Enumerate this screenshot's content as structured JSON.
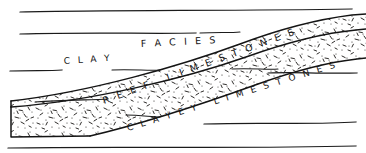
{
  "figure": {
    "kind": "geological-cross-section",
    "background_color": "#ffffff",
    "ink_color": "#141414",
    "width": 366,
    "height": 153
  },
  "labels": {
    "facies": "F A C I E S",
    "clay": "C L A Y",
    "reef_limestones": "R E E F   L I M E S T O N E S",
    "clayey_limestones": "C L A Y E Y   L I M E S T O N E S"
  },
  "units": [
    {
      "id": "clay",
      "name": "CLAY",
      "texture": "blank",
      "position": "upper-left"
    },
    {
      "id": "reef-limestones",
      "name": "REEF LIMESTONES",
      "texture": "stipple",
      "position": "diagonal-wedge"
    },
    {
      "id": "clayey-limestones",
      "name": "CLAYEY LIMESTONES",
      "texture": "blank",
      "position": "lower-right"
    }
  ],
  "bedding_lines": [
    {
      "id": "bed-1",
      "d": "M 20 12 L 352 9"
    },
    {
      "id": "bed-2",
      "d": "M 20 34 L 196 33"
    },
    {
      "id": "bed-3",
      "d": "M 10 71 L 62 70"
    },
    {
      "id": "bed-4",
      "d": "M 268 73 L 357 73"
    },
    {
      "id": "bed-5",
      "d": "M 204 124 L 356 122"
    },
    {
      "id": "bed-6",
      "d": "M 8 148 L 356 146"
    }
  ],
  "leader_lines": [
    {
      "id": "leader-facies",
      "d": "M 200 33 L 240 32"
    },
    {
      "id": "leader-clay",
      "d": "M 112 70 L 160 70"
    },
    {
      "id": "leader-reef-left",
      "d": "M 35 102 L 108 99"
    },
    {
      "id": "leader-reef-right",
      "d": "M 232 69 L 278 69"
    },
    {
      "id": "leader-clayey",
      "d": "M 126 115 L 160 117"
    }
  ],
  "facies_boundaries": [
    {
      "id": "upper-contact",
      "d": "M 11 101 C 90 92, 180 66, 240 44 C 280 29, 320 19, 352 15"
    },
    {
      "id": "mid-contact",
      "d": "M 11 107 C 92 101, 186 78, 246 57 C 288 42, 324 33, 356 30"
    },
    {
      "id": "lower-contact",
      "d": "M 90 136 C 150 122, 208 102, 258 84 C 300 69, 330 62, 357 59"
    }
  ],
  "palette": {
    "paper": "#ffffff",
    "ink": "#141414",
    "stipple": "#23211f"
  }
}
